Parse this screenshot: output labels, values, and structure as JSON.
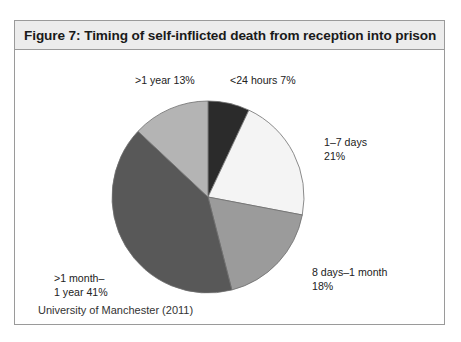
{
  "figure": {
    "title": "Figure 7: Timing of self-inflicted death from reception into prison",
    "source": "University of Manchester (2011)"
  },
  "chart_data": {
    "type": "pie",
    "title": "Figure 7: Timing of self-inflicted death from reception into prison",
    "source": "University of Manchester (2011)",
    "unit": "percent",
    "start_angle_deg": 0,
    "direction": "clockwise",
    "legend": "none",
    "labels_position": "outside",
    "categories": [
      "<24 hours",
      "1–7 days",
      "8 days–1 month",
      ">1 month–1 year",
      ">1 year"
    ],
    "values": [
      7,
      21,
      18,
      41,
      13
    ],
    "slices": [
      {
        "name": "<24 hours",
        "value": 7,
        "label": "<24 hours 7%",
        "color": "#2b2b2b",
        "start_deg": 0,
        "end_deg": 25.2
      },
      {
        "name": "1–7 days",
        "value": 21,
        "label": "1–7 days\n21%",
        "color": "#f4f4f4",
        "start_deg": 25.2,
        "end_deg": 100.8
      },
      {
        "name": "8 days–1 month",
        "value": 18,
        "label": "8 days–1 month\n18%",
        "color": "#9b9b9b",
        "start_deg": 100.8,
        "end_deg": 165.6
      },
      {
        "name": ">1 month–1 year",
        "value": 41,
        "label": ">1 month–\n1 year 41%",
        "color": "#585858",
        "start_deg": 165.6,
        "end_deg": 313.2
      },
      {
        "name": ">1 year",
        "value": 13,
        "label": ">1 year 13%",
        "color": "#b4b4b4",
        "start_deg": 313.2,
        "end_deg": 360
      }
    ],
    "total": 100
  },
  "style": {
    "frame_border": "#9a9a9a",
    "title_bar_background": "#ececec",
    "slice_outline": "#6f6f6f",
    "page_background": "#ffffff"
  }
}
